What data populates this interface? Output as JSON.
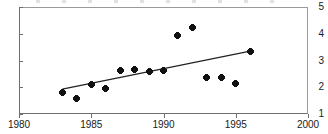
{
  "chart_data": {
    "type": "scatter",
    "title": "",
    "xlabel": "",
    "ylabel": "",
    "xlim": [
      1980,
      2000
    ],
    "ylim": [
      1,
      5
    ],
    "grid": false,
    "legend": null,
    "xticks": [
      "1980",
      "1985",
      "1990",
      "1995",
      "2000"
    ],
    "xtick_values": [
      1980,
      1985,
      1990,
      1995,
      2000
    ],
    "yticks": [
      "1",
      "2",
      "3",
      "4",
      "5"
    ],
    "ytick_values": [
      1,
      2,
      3,
      4,
      5
    ],
    "marker_color": "#111111",
    "line_color": "#222222",
    "axis_color": "#6f6f6f",
    "series": [
      {
        "name": "data",
        "marker": "filled-diamond",
        "x": [
          1983,
          1984,
          1985,
          1986,
          1987,
          1988,
          1989,
          1990,
          1991,
          1992,
          1993,
          1994,
          1995,
          1996
        ],
        "y": [
          1.82,
          1.58,
          2.12,
          1.94,
          2.61,
          2.67,
          2.6,
          2.64,
          3.93,
          4.23,
          2.35,
          2.37,
          2.15,
          3.33
        ]
      },
      {
        "name": "trend",
        "type": "line",
        "x": [
          1983,
          1996
        ],
        "y": [
          1.93,
          3.35
        ]
      }
    ]
  }
}
